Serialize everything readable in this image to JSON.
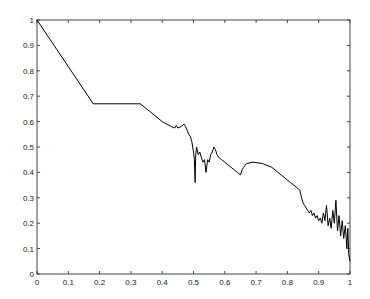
{
  "chart_data": {
    "type": "line",
    "title": "",
    "xlabel": "",
    "ylabel": "",
    "xlim": [
      0,
      1
    ],
    "ylim": [
      0,
      1
    ],
    "grid": false,
    "legend": null,
    "x_ticks": [
      "0",
      "0.1",
      "0.2",
      "0.3",
      "0.4",
      "0.5",
      "0.6",
      "0.7",
      "0.8",
      "0.9",
      "1"
    ],
    "y_ticks": [
      "0",
      "0.1",
      "0.2",
      "0.3",
      "0.4",
      "0.5",
      "0.6",
      "0.7",
      "0.8",
      "0.9",
      "1"
    ],
    "series": [
      {
        "name": "curve",
        "color": "#000000",
        "points": [
          [
            0.0,
            1.0
          ],
          [
            0.18,
            0.67
          ],
          [
            0.33,
            0.67
          ],
          [
            0.36,
            0.64
          ],
          [
            0.4,
            0.6
          ],
          [
            0.43,
            0.58
          ],
          [
            0.44,
            0.575
          ],
          [
            0.445,
            0.585
          ],
          [
            0.45,
            0.575
          ],
          [
            0.46,
            0.58
          ],
          [
            0.47,
            0.59
          ],
          [
            0.475,
            0.58
          ],
          [
            0.48,
            0.565
          ],
          [
            0.485,
            0.55
          ],
          [
            0.49,
            0.54
          ],
          [
            0.495,
            0.52
          ],
          [
            0.5,
            0.48
          ],
          [
            0.503,
            0.45
          ],
          [
            0.505,
            0.36
          ],
          [
            0.507,
            0.47
          ],
          [
            0.51,
            0.5
          ],
          [
            0.515,
            0.47
          ],
          [
            0.52,
            0.48
          ],
          [
            0.525,
            0.46
          ],
          [
            0.53,
            0.44
          ],
          [
            0.535,
            0.45
          ],
          [
            0.54,
            0.4
          ],
          [
            0.545,
            0.45
          ],
          [
            0.55,
            0.44
          ],
          [
            0.555,
            0.47
          ],
          [
            0.56,
            0.48
          ],
          [
            0.565,
            0.5
          ],
          [
            0.57,
            0.49
          ],
          [
            0.575,
            0.47
          ],
          [
            0.58,
            0.46
          ],
          [
            0.59,
            0.45
          ],
          [
            0.6,
            0.44
          ],
          [
            0.61,
            0.43
          ],
          [
            0.62,
            0.42
          ],
          [
            0.63,
            0.41
          ],
          [
            0.64,
            0.4
          ],
          [
            0.65,
            0.39
          ],
          [
            0.655,
            0.41
          ],
          [
            0.66,
            0.42
          ],
          [
            0.67,
            0.435
          ],
          [
            0.69,
            0.44
          ],
          [
            0.72,
            0.435
          ],
          [
            0.75,
            0.42
          ],
          [
            0.78,
            0.39
          ],
          [
            0.81,
            0.36
          ],
          [
            0.83,
            0.34
          ],
          [
            0.84,
            0.33
          ],
          [
            0.845,
            0.3
          ],
          [
            0.85,
            0.28
          ],
          [
            0.855,
            0.27
          ],
          [
            0.86,
            0.26
          ],
          [
            0.865,
            0.25
          ],
          [
            0.87,
            0.24
          ],
          [
            0.875,
            0.25
          ],
          [
            0.88,
            0.23
          ],
          [
            0.885,
            0.24
          ],
          [
            0.89,
            0.22
          ],
          [
            0.895,
            0.23
          ],
          [
            0.9,
            0.21
          ],
          [
            0.905,
            0.22
          ],
          [
            0.91,
            0.2
          ],
          [
            0.915,
            0.24
          ],
          [
            0.92,
            0.21
          ],
          [
            0.925,
            0.27
          ],
          [
            0.93,
            0.19
          ],
          [
            0.935,
            0.22
          ],
          [
            0.94,
            0.18
          ],
          [
            0.945,
            0.25
          ],
          [
            0.95,
            0.2
          ],
          [
            0.955,
            0.29
          ],
          [
            0.96,
            0.17
          ],
          [
            0.965,
            0.23
          ],
          [
            0.97,
            0.15
          ],
          [
            0.975,
            0.21
          ],
          [
            0.98,
            0.14
          ],
          [
            0.985,
            0.19
          ],
          [
            0.99,
            0.1
          ],
          [
            0.993,
            0.18
          ],
          [
            0.996,
            0.08
          ],
          [
            1.0,
            0.05
          ]
        ]
      }
    ]
  }
}
